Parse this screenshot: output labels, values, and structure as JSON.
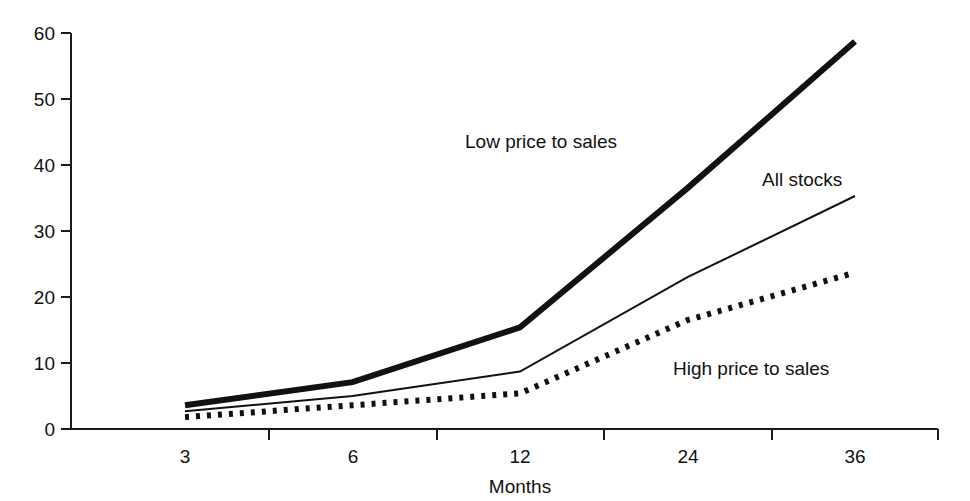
{
  "chart_data": {
    "type": "line",
    "title": "",
    "subtitle": "",
    "xlabel": "Months",
    "ylabel": "",
    "categories": [
      "3",
      "6",
      "12",
      "24",
      "36"
    ],
    "x": [
      3,
      6,
      12,
      24,
      36
    ],
    "xticklabels": [
      "3",
      "6",
      "12",
      "24",
      "36"
    ],
    "yticklabels": [
      "0",
      "10",
      "20",
      "30",
      "40",
      "50",
      "60"
    ],
    "yticks": [
      0,
      10,
      20,
      30,
      40,
      50,
      60
    ],
    "ylim": [
      0,
      60
    ],
    "grid": false,
    "legend_position": "inline-annotations",
    "series": [
      {
        "name": "Low price to sales",
        "style": "thick-solid",
        "values": [
          3.6,
          7.1,
          15.4,
          36.5,
          58.7
        ]
      },
      {
        "name": "All stocks",
        "style": "thin-solid",
        "values": [
          2.7,
          5.0,
          8.7,
          23.0,
          35.3
        ]
      },
      {
        "name": "High price to sales",
        "style": "dotted",
        "values": [
          1.8,
          3.6,
          5.4,
          16.5,
          23.7
        ]
      }
    ],
    "annotations": [
      {
        "text": "Low price to sales",
        "x_px": 465,
        "y_px": 148
      },
      {
        "text": "All stocks",
        "x_px": 762,
        "y_px": 186
      },
      {
        "text": "High price to sales",
        "x_px": 673,
        "y_px": 375
      }
    ]
  },
  "axes": {
    "y_tick_0": "0",
    "y_tick_10": "10",
    "y_tick_20": "20",
    "y_tick_30": "30",
    "y_tick_40": "40",
    "y_tick_50": "50",
    "y_tick_60": "60",
    "x_tick_3": "3",
    "x_tick_6": "6",
    "x_tick_12": "12",
    "x_tick_24": "24",
    "x_tick_36": "36",
    "x_axis_title": "Months"
  },
  "colors": {
    "line": "#111111",
    "axis": "#1a1a1a",
    "background": "#ffffff"
  }
}
